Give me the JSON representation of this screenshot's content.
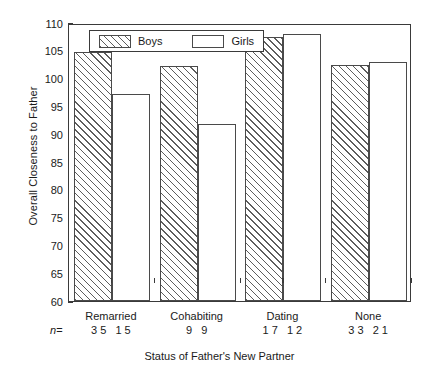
{
  "chart_data": {
    "type": "bar",
    "title": "",
    "xlabel": "Status of Father's New Partner",
    "ylabel": "Overall Closeness to Father",
    "categories": [
      "Remarried",
      "Cohabiting",
      "Dating",
      "None"
    ],
    "ylim": [
      60,
      110
    ],
    "yticks": [
      60,
      65,
      70,
      75,
      80,
      85,
      90,
      95,
      100,
      105,
      110
    ],
    "grid": false,
    "legend_position": "top-left-inside",
    "series": [
      {
        "name": "Boys",
        "values": [
          104.8,
          102.3,
          107.4,
          102.4
        ],
        "n": [
          35,
          9,
          17,
          33
        ]
      },
      {
        "name": "Girls",
        "values": [
          97.2,
          91.9,
          108.0,
          103.0
        ],
        "n": [
          15,
          9,
          12,
          21
        ]
      }
    ],
    "n_label": "n",
    "n_equals": "=",
    "annotations": []
  },
  "legend": {
    "items": [
      {
        "label": "Boys",
        "pattern": "diagonal-hatch"
      },
      {
        "label": "Girls",
        "pattern": "solid-white"
      }
    ]
  }
}
